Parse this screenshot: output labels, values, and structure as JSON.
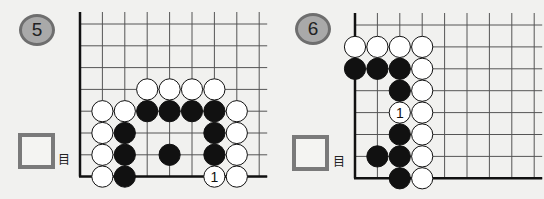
{
  "problems": [
    {
      "number": "5",
      "unit_label": "目",
      "answer_value": "",
      "board": {
        "origin_x": 80,
        "origin_y": 24,
        "spacing_x": 22.4,
        "spacing_y": 21.8,
        "cols": 9,
        "rows": 8,
        "edges": [
          "left",
          "bottom"
        ],
        "stones": [
          {
            "c": 3,
            "r": 3,
            "color": "white"
          },
          {
            "c": 4,
            "r": 3,
            "color": "white"
          },
          {
            "c": 5,
            "r": 3,
            "color": "white"
          },
          {
            "c": 6,
            "r": 3,
            "color": "white"
          },
          {
            "c": 1,
            "r": 4,
            "color": "white"
          },
          {
            "c": 2,
            "r": 4,
            "color": "white"
          },
          {
            "c": 3,
            "r": 4,
            "color": "black"
          },
          {
            "c": 4,
            "r": 4,
            "color": "black"
          },
          {
            "c": 5,
            "r": 4,
            "color": "black"
          },
          {
            "c": 6,
            "r": 4,
            "color": "black"
          },
          {
            "c": 7,
            "r": 4,
            "color": "white"
          },
          {
            "c": 1,
            "r": 5,
            "color": "white"
          },
          {
            "c": 2,
            "r": 5,
            "color": "black"
          },
          {
            "c": 6,
            "r": 5,
            "color": "black"
          },
          {
            "c": 7,
            "r": 5,
            "color": "white"
          },
          {
            "c": 1,
            "r": 6,
            "color": "white"
          },
          {
            "c": 2,
            "r": 6,
            "color": "black"
          },
          {
            "c": 4,
            "r": 6,
            "color": "black"
          },
          {
            "c": 6,
            "r": 6,
            "color": "black"
          },
          {
            "c": 7,
            "r": 6,
            "color": "white"
          },
          {
            "c": 1,
            "r": 7,
            "color": "white"
          },
          {
            "c": 2,
            "r": 7,
            "color": "black"
          },
          {
            "c": 6,
            "r": 7,
            "color": "white",
            "label": "1"
          },
          {
            "c": 7,
            "r": 7,
            "color": "white"
          }
        ]
      }
    },
    {
      "number": "6",
      "unit_label": "目",
      "answer_value": "",
      "board": {
        "origin_x": 355,
        "origin_y": 25,
        "spacing_x": 22.4,
        "spacing_y": 21.9,
        "cols": 9,
        "rows": 8,
        "edges": [
          "left",
          "bottom"
        ],
        "stones": [
          {
            "c": 0,
            "r": 1,
            "color": "white"
          },
          {
            "c": 1,
            "r": 1,
            "color": "white"
          },
          {
            "c": 2,
            "r": 1,
            "color": "white"
          },
          {
            "c": 3,
            "r": 1,
            "color": "white"
          },
          {
            "c": 0,
            "r": 2,
            "color": "black"
          },
          {
            "c": 1,
            "r": 2,
            "color": "black"
          },
          {
            "c": 2,
            "r": 2,
            "color": "black"
          },
          {
            "c": 3,
            "r": 2,
            "color": "white"
          },
          {
            "c": 2,
            "r": 3,
            "color": "black"
          },
          {
            "c": 3,
            "r": 3,
            "color": "white"
          },
          {
            "c": 2,
            "r": 4,
            "color": "white",
            "label": "1"
          },
          {
            "c": 3,
            "r": 4,
            "color": "white"
          },
          {
            "c": 2,
            "r": 5,
            "color": "black"
          },
          {
            "c": 3,
            "r": 5,
            "color": "white"
          },
          {
            "c": 1,
            "r": 6,
            "color": "black"
          },
          {
            "c": 2,
            "r": 6,
            "color": "black"
          },
          {
            "c": 3,
            "r": 6,
            "color": "white"
          },
          {
            "c": 2,
            "r": 7,
            "color": "black"
          },
          {
            "c": 3,
            "r": 7,
            "color": "white"
          }
        ]
      }
    }
  ],
  "colors": {
    "badge_fill": "#a9a9a9",
    "badge_border": "#6e6e6e",
    "box_border": "#7a7a7a",
    "grid": "#555555",
    "edge": "#111111"
  }
}
